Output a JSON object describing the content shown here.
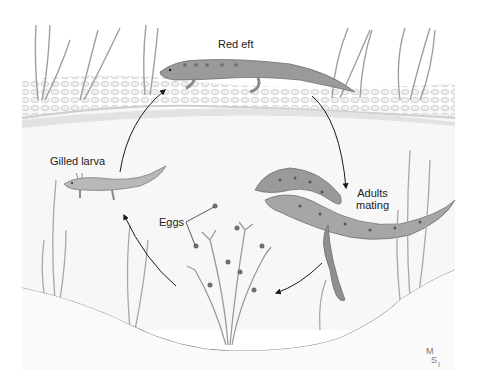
{
  "diagram": {
    "type": "life-cycle",
    "stages": [
      {
        "id": "red_eft",
        "label": "Red eft"
      },
      {
        "id": "adults_mating",
        "label_line1": "Adults",
        "label_line2": "mating"
      },
      {
        "id": "eggs",
        "label": "Eggs"
      },
      {
        "id": "gilled_larva",
        "label": "Gilled larva"
      }
    ],
    "flow": [
      "red_eft",
      "adults_mating",
      "eggs",
      "gilled_larva",
      "red_eft"
    ],
    "signature": "MSI",
    "colors": {
      "background": "#ffffff",
      "land": "#d9d9d9",
      "gravel": "#e8e8e8",
      "water": "#f4f4f4",
      "creature": "#9a9a9a",
      "creature_dark": "#6e6e6e",
      "plant": "#b5b5b5",
      "arrow": "#1a1a1a",
      "text": "#222222"
    }
  }
}
